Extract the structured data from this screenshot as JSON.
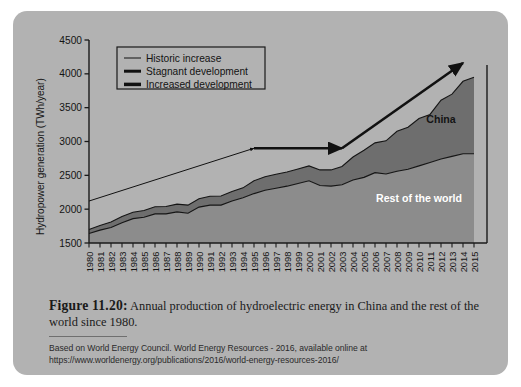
{
  "figure": {
    "caption_label": "Figure 11.20:",
    "caption_text": " Annual production of hydroelectric energy in China and the rest of the world since 1980.",
    "source_note": "Based on World Energy Council. World Energy Resources - 2016, available online at https://www.worldenergy.org/publications/2016/world-energy-resources-2016/"
  },
  "colors": {
    "card_background": "#b2b2b2",
    "plot_background": "#b2b2b2",
    "rest_of_world_fill": "#8c8c8c",
    "china_fill": "#6e6e6e",
    "axis": "#1a1a1a",
    "annotation": "#111111",
    "legend_border": "#1a1a1a"
  },
  "chart_data": {
    "type": "area",
    "stacked": true,
    "title": "",
    "xlabel": "",
    "ylabel": "Hydropower generation (TWh/year)",
    "ylim": [
      1500,
      4500
    ],
    "yticks": [
      1500,
      2000,
      2500,
      3000,
      3500,
      4000,
      4500
    ],
    "grid": false,
    "legend_position": "top-left",
    "categories": [
      "1980",
      "1981",
      "1982",
      "1983",
      "1984",
      "1985",
      "1986",
      "1987",
      "1988",
      "1989",
      "1990",
      "1991",
      "1992",
      "1993",
      "1994",
      "1995",
      "1996",
      "1997",
      "1998",
      "1999",
      "2000",
      "2001",
      "2002",
      "2003",
      "2004",
      "2005",
      "2006",
      "2007",
      "2008",
      "2009",
      "2010",
      "2011",
      "2012",
      "2013",
      "2014",
      "2015"
    ],
    "series": [
      {
        "name": "Rest of the world",
        "fill": "#8c8c8c",
        "values": [
          1640,
          1690,
          1730,
          1800,
          1860,
          1880,
          1930,
          1930,
          1960,
          1940,
          2030,
          2060,
          2060,
          2120,
          2170,
          2230,
          2280,
          2310,
          2340,
          2380,
          2420,
          2350,
          2340,
          2360,
          2430,
          2470,
          2540,
          2520,
          2560,
          2590,
          2640,
          2690,
          2740,
          2780,
          2820,
          2820
        ]
      },
      {
        "name": "China",
        "fill": "#6e6e6e",
        "values": [
          60,
          70,
          80,
          90,
          95,
          100,
          105,
          110,
          115,
          120,
          125,
          130,
          135,
          140,
          145,
          190,
          200,
          205,
          210,
          215,
          220,
          230,
          240,
          270,
          340,
          400,
          440,
          490,
          590,
          620,
          700,
          710,
          870,
          920,
          1070,
          1130
        ]
      }
    ],
    "totals": [
      1700,
      1760,
      1810,
      1890,
      1955,
      1980,
      2035,
      2040,
      2075,
      2060,
      2155,
      2190,
      2195,
      2260,
      2315,
      2420,
      2480,
      2515,
      2550,
      2595,
      2640,
      2580,
      2580,
      2630,
      2770,
      2870,
      2980,
      3010,
      3150,
      3210,
      3340,
      3400,
      3610,
      3700,
      3890,
      3950
    ],
    "annotations": [
      {
        "name": "China",
        "text": "China",
        "color": "#141414",
        "x_year": "2012",
        "y_value": 3270
      },
      {
        "name": "Rest of the world",
        "text": "Rest of the world",
        "color": "#ffffff",
        "x_year": "2010",
        "y_value": 2100
      }
    ]
  },
  "legend": {
    "items": [
      {
        "label": "Historic increase",
        "width": 1
      },
      {
        "label": "Stagnant development",
        "width": 3
      },
      {
        "label": "Increased development",
        "width": 3.5
      }
    ]
  },
  "arrows": {
    "historic_increase": {
      "label": "Historic increase",
      "from_year": "1980",
      "from_value": 2120,
      "to_year": "1995",
      "to_value": 2900
    },
    "stagnant_development": {
      "label": "Stagnant development",
      "from_year": "1995",
      "from_value": 2900,
      "to_year": "2003",
      "to_value": 2900
    },
    "increased_development": {
      "label": "Increased development",
      "from_year": "2003",
      "from_value": 2900,
      "to_year": "2014",
      "to_value": 4160
    }
  }
}
